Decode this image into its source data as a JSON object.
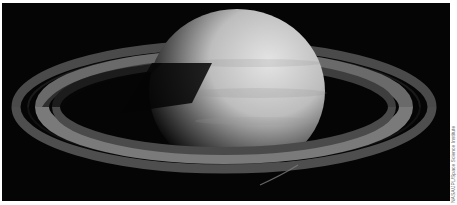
{
  "image": {
    "subject": "Saturn with rings",
    "alt": "Grayscale photograph of Saturn with its ring system against black space",
    "colors": {
      "background": "#050505",
      "planet_light": "#d8d8d8",
      "planet_shadow": "#1a1a1a",
      "ring": "#6e6e6e",
      "border": "#ffffff"
    }
  },
  "credit": {
    "text": "NASA/JPL/Space Science Institute"
  }
}
